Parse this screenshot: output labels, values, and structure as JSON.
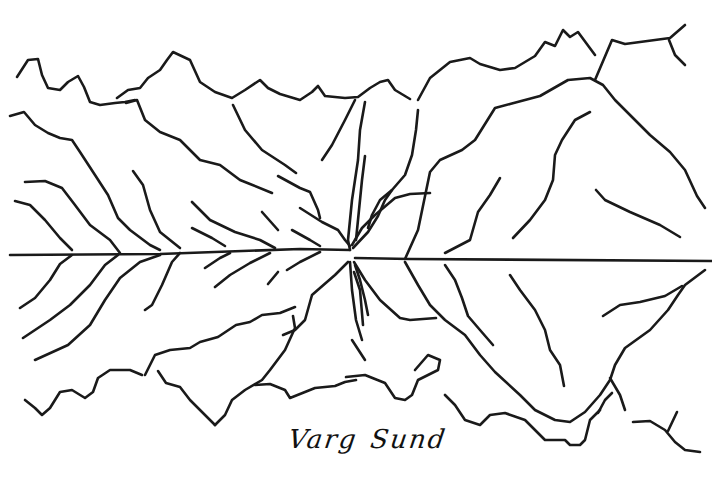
{
  "artwork": {
    "type": "pen-and-ink line drawing",
    "subject": "mountains reflected in still water",
    "caption_words": [
      "Varg",
      "Sund"
    ],
    "caption": "Varg Sund",
    "colors": {
      "ink": "#1a1a1a",
      "paper": "#ffffff"
    },
    "stroke_width": 2.6
  }
}
